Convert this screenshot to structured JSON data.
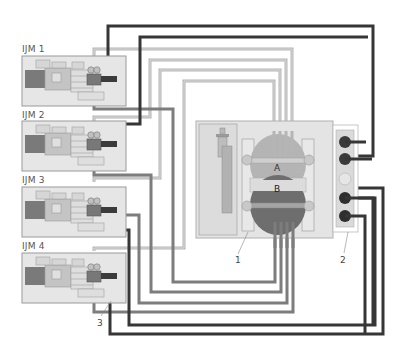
{
  "diagram": {
    "title": "",
    "machines": [
      {
        "id": "ijm1",
        "label": "IJM 1"
      },
      {
        "id": "ijm2",
        "label": "IJM 2"
      },
      {
        "id": "ijm3",
        "label": "IJM 3"
      },
      {
        "id": "ijm4",
        "label": "IJM 4"
      }
    ],
    "central_unit": {
      "vessel_a_label": "A",
      "vessel_b_label": "B"
    },
    "callouts": [
      {
        "id": "c1",
        "text": "1",
        "target": "central unit"
      },
      {
        "id": "c2",
        "text": "2",
        "target": "connection panel"
      },
      {
        "id": "c3",
        "text": "3",
        "target": "IJM 4 valve block"
      }
    ],
    "colors": {
      "line_dark": "#3a3a3a",
      "line_mid": "#7d7d7d",
      "line_light": "#b9b9b9",
      "machine_bg": "#e6e6e6",
      "vessel_a": "#b4b4b4",
      "vessel_b": "#6e6e6e",
      "panel_bg": "#dcdcdc"
    }
  }
}
